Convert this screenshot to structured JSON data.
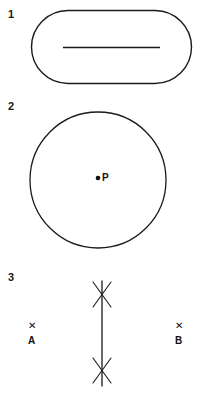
{
  "page": {
    "width": 202,
    "height": 393,
    "background": "#ffffff",
    "ink_color": "#1a1a1a"
  },
  "figures": [
    {
      "number": "1",
      "shape": "stadium-rounded-rectangle",
      "interior_element": "horizontal-line-segment",
      "geometry": {
        "x": 31,
        "y": 10,
        "width": 161,
        "height": 74,
        "corner_radius": 37,
        "line_x1": 63,
        "line_y1": 47,
        "line_x2": 160,
        "line_y2": 47
      }
    },
    {
      "number": "2",
      "shape": "circle",
      "interior_element": "center-point",
      "point_label": "P",
      "geometry": {
        "cx": 98,
        "cy": 180,
        "r": 68,
        "dot_cx": 98,
        "dot_cy": 178,
        "dot_r": 2.2
      }
    },
    {
      "number": "3",
      "shape": "perpendicular-bisector-construction",
      "point_labels": [
        "A",
        "B"
      ],
      "point_marks": [
        "X",
        "X"
      ],
      "geometry": {
        "line_x": 102,
        "line_y1": 281,
        "line_y2": 386,
        "top_cross_cy": 294,
        "bottom_cross_cy": 371,
        "cross_half_width": 10,
        "cross_half_height": 14,
        "mark_a_x": 33,
        "mark_a_y": 327,
        "mark_b_x": 180,
        "mark_b_y": 327
      }
    }
  ],
  "labels": {
    "fig1_number": "1",
    "fig2_number": "2",
    "fig3_number": "3",
    "center_point": "P",
    "point_a": "A",
    "point_b": "B",
    "x_mark_a": "✕",
    "x_mark_b": "✕"
  }
}
